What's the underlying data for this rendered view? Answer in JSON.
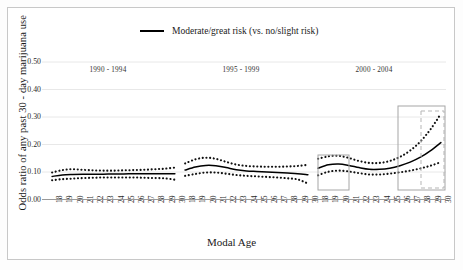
{
  "chart_data": {
    "type": "line",
    "title": "",
    "xlabel": "Modal Age",
    "ylabel": "Odds ratio of any past 30 - day marijuana use",
    "ylim": [
      0.0,
      0.55
    ],
    "yticks": [
      "0.00",
      "0.10",
      "0.20",
      "0.30",
      "0.40",
      "0.50"
    ],
    "ytick_values": [
      0.0,
      0.1,
      0.2,
      0.3,
      0.4,
      0.5
    ],
    "grid": true,
    "legend": [
      {
        "label": "Moderate/great risk (vs. no/slight risk)",
        "color": "#000000",
        "style": "solid"
      }
    ],
    "legend_position": "top-center",
    "panel_labels": [
      "1990 - 1994",
      "1995 - 1999",
      "2000 - 2004"
    ],
    "xtick_labels": [
      "18",
      "19",
      "20",
      "21",
      "22",
      "23",
      "24",
      "25",
      "26",
      "27",
      "28",
      "29",
      "30",
      "18",
      "19",
      "20",
      "21",
      "22",
      "23",
      "24",
      "25",
      "26",
      "27",
      "28",
      "29",
      "30",
      "18",
      "19",
      "20",
      "21",
      "22",
      "23",
      "24",
      "25",
      "26",
      "27",
      "28",
      "29",
      "30"
    ],
    "series": [
      {
        "name": "1990 - 1994 estimate",
        "panel": 0,
        "x": [
          18,
          19,
          20,
          21,
          22,
          23,
          24,
          25,
          26,
          27,
          28,
          29,
          30
        ],
        "values": [
          0.084,
          0.089,
          0.091,
          0.092,
          0.092,
          0.092,
          0.093,
          0.093,
          0.094,
          0.094,
          0.094,
          0.094,
          0.094
        ]
      },
      {
        "name": "1990 - 1994 upper CI",
        "panel": 0,
        "x": [
          18,
          19,
          20,
          21,
          22,
          23,
          24,
          25,
          26,
          27,
          28,
          29,
          30
        ],
        "values": [
          0.098,
          0.107,
          0.11,
          0.108,
          0.106,
          0.105,
          0.105,
          0.106,
          0.107,
          0.108,
          0.11,
          0.112,
          0.116
        ]
      },
      {
        "name": "1990 - 1994 lower CI",
        "panel": 0,
        "x": [
          18,
          19,
          20,
          21,
          22,
          23,
          24,
          25,
          26,
          27,
          28,
          29,
          30
        ],
        "values": [
          0.07,
          0.074,
          0.076,
          0.078,
          0.079,
          0.08,
          0.08,
          0.08,
          0.08,
          0.079,
          0.078,
          0.077,
          0.072
        ]
      },
      {
        "name": "1995 - 1999 estimate",
        "panel": 1,
        "x": [
          18,
          19,
          20,
          21,
          22,
          23,
          24,
          25,
          26,
          27,
          28,
          29,
          30
        ],
        "values": [
          0.107,
          0.118,
          0.124,
          0.123,
          0.116,
          0.108,
          0.104,
          0.102,
          0.1,
          0.098,
          0.096,
          0.094,
          0.09
        ]
      },
      {
        "name": "1995 - 1999 upper CI",
        "panel": 1,
        "x": [
          18,
          19,
          20,
          21,
          22,
          23,
          24,
          25,
          26,
          27,
          28,
          29,
          30
        ],
        "values": [
          0.131,
          0.146,
          0.152,
          0.148,
          0.137,
          0.127,
          0.122,
          0.12,
          0.119,
          0.119,
          0.12,
          0.122,
          0.126
        ]
      },
      {
        "name": "1995 - 1999 lower CI",
        "panel": 1,
        "x": [
          18,
          19,
          20,
          21,
          22,
          23,
          24,
          25,
          26,
          27,
          28,
          29,
          30
        ],
        "values": [
          0.086,
          0.093,
          0.098,
          0.098,
          0.094,
          0.089,
          0.086,
          0.084,
          0.082,
          0.08,
          0.077,
          0.073,
          0.058
        ]
      },
      {
        "name": "2000 - 2004 estimate",
        "panel": 2,
        "x": [
          18,
          19,
          20,
          21,
          22,
          23,
          24,
          25,
          26,
          27,
          28,
          29,
          30
        ],
        "values": [
          0.114,
          0.126,
          0.129,
          0.124,
          0.116,
          0.11,
          0.11,
          0.114,
          0.123,
          0.136,
          0.154,
          0.178,
          0.207
        ]
      },
      {
        "name": "2000 - 2004 upper CI",
        "panel": 2,
        "x": [
          18,
          19,
          20,
          21,
          22,
          23,
          24,
          25,
          26,
          27,
          28,
          29,
          30
        ],
        "values": [
          0.148,
          0.157,
          0.159,
          0.151,
          0.14,
          0.133,
          0.133,
          0.14,
          0.155,
          0.178,
          0.211,
          0.256,
          0.312
        ]
      },
      {
        "name": "2000 - 2004 lower CI",
        "panel": 2,
        "x": [
          18,
          19,
          20,
          21,
          22,
          23,
          24,
          25,
          26,
          27,
          28,
          29,
          30
        ],
        "values": [
          0.088,
          0.101,
          0.105,
          0.102,
          0.096,
          0.091,
          0.091,
          0.094,
          0.099,
          0.105,
          0.113,
          0.123,
          0.136
        ]
      }
    ],
    "annotations": [
      {
        "name": "highlight-box-left",
        "style": "solid",
        "color": "#a6a6a6",
        "x": 318,
        "y": 155,
        "width": 31,
        "height": 35
      },
      {
        "name": "highlight-box-right",
        "style": "solid",
        "color": "#a6a6a6",
        "x": 398,
        "y": 106,
        "width": 47,
        "height": 84
      },
      {
        "name": "highlight-box-right-inner",
        "style": "dashed",
        "color": "#b5b5b5",
        "x": 421,
        "y": 111,
        "width": 23,
        "height": 77
      }
    ]
  }
}
